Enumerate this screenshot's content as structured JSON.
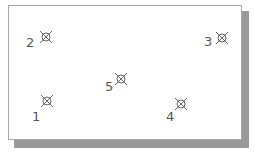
{
  "diagram": {
    "points": [
      {
        "id": "1",
        "label": "1",
        "x": 47,
        "y": 101,
        "lx": 32,
        "ly": 110
      },
      {
        "id": "2",
        "label": "2",
        "x": 46,
        "y": 37,
        "lx": 26,
        "ly": 36
      },
      {
        "id": "3",
        "label": "3",
        "x": 222,
        "y": 38,
        "lx": 204,
        "ly": 35
      },
      {
        "id": "4",
        "label": "4",
        "x": 181,
        "y": 104,
        "lx": 166,
        "ly": 110
      },
      {
        "id": "5",
        "label": "5",
        "x": 121,
        "y": 79,
        "lx": 105,
        "ly": 80
      }
    ],
    "marker_icon": "circle-x-marker",
    "colors": {
      "frame_border": "#a8a8a8",
      "shadow": "#9a9a9a",
      "marker": "#666666",
      "label": "#555555"
    }
  }
}
